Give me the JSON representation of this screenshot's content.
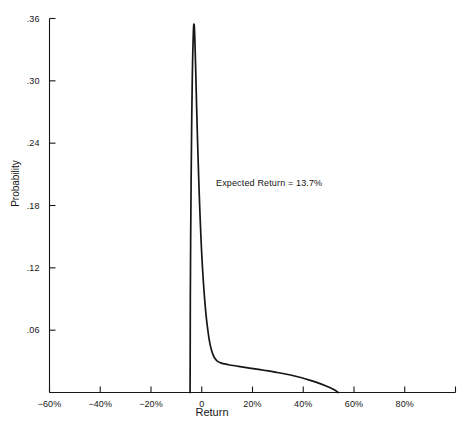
{
  "chart_data": {
    "type": "line",
    "title": "",
    "xlabel": "Return",
    "ylabel": "Probability",
    "xlim": [
      -60,
      100
    ],
    "ylim": [
      0,
      0.36
    ],
    "grid": false,
    "legend": null,
    "x_ticks": [
      {
        "value": -60,
        "label": "−60%"
      },
      {
        "value": -40,
        "label": "−40%"
      },
      {
        "value": -20,
        "label": "−20%"
      },
      {
        "value": 0,
        "label": "0"
      },
      {
        "value": 20,
        "label": "20%"
      },
      {
        "value": 40,
        "label": "40%"
      },
      {
        "value": 60,
        "label": "60%"
      },
      {
        "value": 80,
        "label": "80%"
      },
      {
        "value": 100,
        "label": ""
      }
    ],
    "y_ticks": [
      {
        "value": 0.36,
        "label": ".36"
      },
      {
        "value": 0.3,
        "label": ".30"
      },
      {
        "value": 0.24,
        "label": ".24"
      },
      {
        "value": 0.18,
        "label": ".18"
      },
      {
        "value": 0.12,
        "label": ".12"
      },
      {
        "value": 0.06,
        "label": ".06"
      }
    ],
    "annotations": [
      {
        "name": "expected-return",
        "text": "Expected Return = 13.7%",
        "x": 13.7,
        "y": 0.2
      }
    ],
    "series": [
      {
        "name": "Return probability distribution",
        "color": "#161616",
        "x": [
          -4.6,
          -4.5,
          -4.2,
          -3.8,
          -3.4,
          -3.0,
          -2.6,
          -2.2,
          -1.8,
          -1.4,
          -1.0,
          -0.5,
          0.0,
          0.6,
          1.2,
          1.8,
          2.4,
          3.0,
          3.6,
          4.2,
          5.0,
          6.0,
          7.5,
          9.0,
          11.0,
          13.7,
          17.0,
          21.0,
          25.0,
          29.0,
          33.0,
          37.0,
          41.0,
          45.0,
          49.0,
          52.0,
          53.8
        ],
        "y": [
          0.0,
          0.09,
          0.2,
          0.29,
          0.339,
          0.354,
          0.33,
          0.292,
          0.255,
          0.222,
          0.192,
          0.16,
          0.133,
          0.108,
          0.088,
          0.072,
          0.06,
          0.05,
          0.043,
          0.038,
          0.0335,
          0.0305,
          0.0285,
          0.0275,
          0.0265,
          0.0255,
          0.0242,
          0.0227,
          0.0212,
          0.0196,
          0.0178,
          0.0156,
          0.013,
          0.01,
          0.0062,
          0.0028,
          0.0
        ]
      }
    ]
  },
  "axes": {
    "y_title": "Probability",
    "x_title": "Return"
  }
}
